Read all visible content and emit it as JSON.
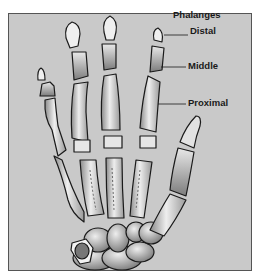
{
  "diagram": {
    "title": "Phalanges",
    "labels": [
      {
        "id": "distal",
        "text": "Distal"
      },
      {
        "id": "middle",
        "text": "Middle"
      },
      {
        "id": "proximal",
        "text": "Proximal"
      }
    ],
    "colors": {
      "background": "#c9c9c9",
      "frame_border": "#555555",
      "bone_light": "#f0f0f0",
      "bone_dark": "#7a7a7a",
      "outline": "#1a1a1a"
    }
  }
}
